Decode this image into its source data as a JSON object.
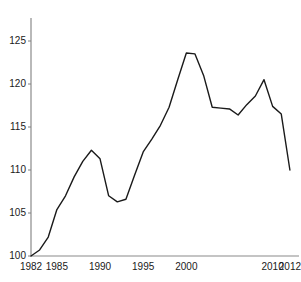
{
  "chart_data": {
    "type": "line",
    "title": "",
    "subtitle": "",
    "xlabel": "",
    "ylabel": "",
    "xlim": [
      1982,
      2012
    ],
    "ylim": [
      100,
      125
    ],
    "grid": false,
    "legend": null,
    "x_ticks": [
      1982,
      1985,
      1990,
      1995,
      2000,
      2010,
      2012
    ],
    "x_tick_labels": [
      "1982",
      "1985",
      "1990",
      "1995",
      "2000",
      "2010",
      "2012"
    ],
    "y_ticks": [
      100,
      105,
      110,
      115,
      120,
      125
    ],
    "y_tick_labels": [
      "100",
      "105",
      "110",
      "115",
      "120",
      "125"
    ],
    "line_color": "#1a1a1a",
    "axis_color": "#808080",
    "background_color": "#ffffff",
    "x": [
      1982,
      1983,
      1984,
      1985,
      1986,
      1987,
      1988,
      1989,
      1990,
      1991,
      1992,
      1993,
      1994,
      1995,
      1996,
      1997,
      1998,
      1999,
      2000,
      2001,
      2002,
      2003,
      2004,
      2005,
      2006,
      2007,
      2008,
      2009,
      2010,
      2011,
      2012
    ],
    "values": [
      100.0,
      100.7,
      102.2,
      105.4,
      107.0,
      109.2,
      111.0,
      112.3,
      111.3,
      107.0,
      106.3,
      106.6,
      109.4,
      112.1,
      113.6,
      115.2,
      117.3,
      120.5,
      123.6,
      123.5,
      121.0,
      117.3,
      117.2,
      117.1,
      116.4,
      117.6,
      118.6,
      120.5,
      117.4,
      116.5,
      110.0
    ],
    "series": [
      {
        "name": "index",
        "values": [
          100.0,
          100.7,
          102.2,
          105.4,
          107.0,
          109.2,
          111.0,
          112.3,
          111.3,
          107.0,
          106.3,
          106.6,
          109.4,
          112.1,
          113.6,
          115.2,
          117.3,
          120.5,
          123.6,
          123.5,
          121.0,
          117.3,
          117.2,
          117.1,
          116.4,
          117.6,
          118.6,
          120.5,
          117.4,
          116.5,
          110.0
        ]
      }
    ],
    "annotations": []
  }
}
